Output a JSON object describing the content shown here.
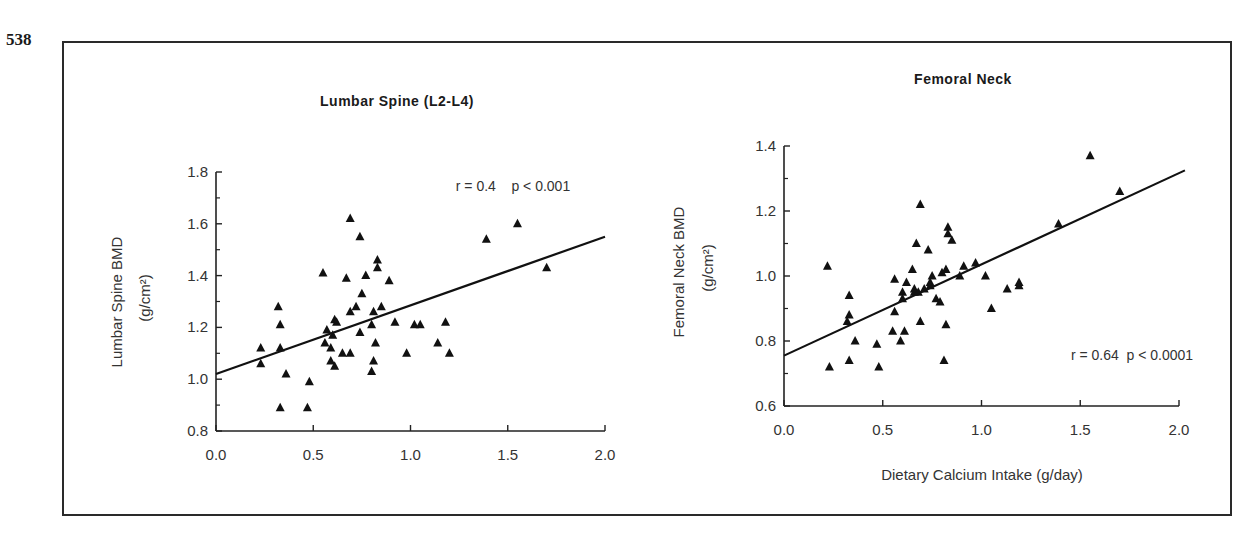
{
  "page_number": "538",
  "chart_data": [
    {
      "type": "scatter",
      "title": "Lumbar Spine (L2-L4)",
      "xlabel": "",
      "ylabel": "Lumbar Spine BMD",
      "ylabel_unit": "(g/cm²)",
      "xlim": [
        0.0,
        2.0
      ],
      "ylim": [
        0.8,
        1.8
      ],
      "xticks": [
        "0.0",
        "0.5",
        "1.0",
        "1.5",
        "2.0"
      ],
      "yticks": [
        "0.8",
        "1.0",
        "1.2",
        "1.4",
        "1.6",
        "1.8"
      ],
      "annotation": "r = 0.4    p < 0.001",
      "marker": "triangle",
      "regression_line": {
        "x": [
          0.0,
          2.0
        ],
        "y": [
          1.02,
          1.55
        ]
      },
      "points": [
        [
          0.23,
          1.12
        ],
        [
          0.23,
          1.06
        ],
        [
          0.32,
          1.28
        ],
        [
          0.33,
          1.21
        ],
        [
          0.33,
          1.12
        ],
        [
          0.36,
          1.02
        ],
        [
          0.33,
          0.89
        ],
        [
          0.47,
          0.89
        ],
        [
          0.48,
          0.99
        ],
        [
          0.55,
          1.41
        ],
        [
          0.56,
          1.14
        ],
        [
          0.57,
          1.19
        ],
        [
          0.59,
          1.12
        ],
        [
          0.59,
          1.07
        ],
        [
          0.6,
          1.17
        ],
        [
          0.61,
          1.23
        ],
        [
          0.62,
          1.22
        ],
        [
          0.61,
          1.05
        ],
        [
          0.65,
          1.1
        ],
        [
          0.67,
          1.39
        ],
        [
          0.69,
          1.62
        ],
        [
          0.69,
          1.26
        ],
        [
          0.69,
          1.1
        ],
        [
          0.72,
          1.28
        ],
        [
          0.74,
          1.55
        ],
        [
          0.74,
          1.18
        ],
        [
          0.75,
          1.33
        ],
        [
          0.77,
          1.4
        ],
        [
          0.8,
          1.21
        ],
        [
          0.8,
          1.03
        ],
        [
          0.81,
          1.26
        ],
        [
          0.81,
          1.07
        ],
        [
          0.82,
          1.14
        ],
        [
          0.83,
          1.46
        ],
        [
          0.83,
          1.43
        ],
        [
          0.85,
          1.28
        ],
        [
          0.89,
          1.38
        ],
        [
          0.92,
          1.22
        ],
        [
          0.98,
          1.1
        ],
        [
          1.02,
          1.21
        ],
        [
          1.05,
          1.21
        ],
        [
          1.14,
          1.14
        ],
        [
          1.18,
          1.22
        ],
        [
          1.2,
          1.1
        ],
        [
          1.39,
          1.54
        ],
        [
          1.55,
          1.6
        ],
        [
          1.7,
          1.43
        ]
      ]
    },
    {
      "type": "scatter",
      "title": "Femoral Neck",
      "xlabel": "Dietary Calcium Intake (g/day)",
      "ylabel": "Femoral Neck BMD",
      "ylabel_unit": "(g/cm²)",
      "xlim": [
        0.0,
        2.0
      ],
      "ylim": [
        0.6,
        1.4
      ],
      "xticks": [
        "0.0",
        "0.5",
        "1.0",
        "1.5",
        "2.0"
      ],
      "yticks": [
        "0.6",
        "0.8",
        "1.0",
        "1.2",
        "1.4"
      ],
      "annotation": "r = 0.64  p < 0.0001",
      "marker": "triangle",
      "regression_line": {
        "x": [
          0.0,
          2.03
        ],
        "y": [
          0.755,
          1.325
        ]
      },
      "points": [
        [
          0.22,
          1.03
        ],
        [
          0.23,
          0.72
        ],
        [
          0.32,
          0.86
        ],
        [
          0.33,
          0.88
        ],
        [
          0.33,
          0.94
        ],
        [
          0.33,
          0.74
        ],
        [
          0.36,
          0.8
        ],
        [
          0.47,
          0.79
        ],
        [
          0.48,
          0.72
        ],
        [
          0.55,
          0.83
        ],
        [
          0.56,
          0.89
        ],
        [
          0.56,
          0.99
        ],
        [
          0.59,
          0.8
        ],
        [
          0.6,
          0.95
        ],
        [
          0.6,
          0.93
        ],
        [
          0.61,
          0.83
        ],
        [
          0.62,
          0.98
        ],
        [
          0.65,
          1.02
        ],
        [
          0.66,
          0.95
        ],
        [
          0.66,
          0.96
        ],
        [
          0.67,
          1.1
        ],
        [
          0.68,
          0.95
        ],
        [
          0.69,
          1.22
        ],
        [
          0.69,
          0.86
        ],
        [
          0.71,
          0.96
        ],
        [
          0.73,
          1.08
        ],
        [
          0.74,
          0.97
        ],
        [
          0.74,
          0.98
        ],
        [
          0.75,
          1.0
        ],
        [
          0.77,
          0.93
        ],
        [
          0.79,
          0.92
        ],
        [
          0.8,
          1.01
        ],
        [
          0.81,
          0.74
        ],
        [
          0.82,
          1.02
        ],
        [
          0.82,
          0.85
        ],
        [
          0.83,
          1.15
        ],
        [
          0.83,
          1.13
        ],
        [
          0.85,
          1.11
        ],
        [
          0.89,
          1.0
        ],
        [
          0.91,
          1.03
        ],
        [
          0.97,
          1.04
        ],
        [
          1.02,
          1.0
        ],
        [
          1.05,
          0.9
        ],
        [
          1.13,
          0.96
        ],
        [
          1.19,
          0.97
        ],
        [
          1.19,
          0.98
        ],
        [
          1.39,
          1.16
        ],
        [
          1.55,
          1.37
        ],
        [
          1.7,
          1.26
        ]
      ]
    }
  ]
}
